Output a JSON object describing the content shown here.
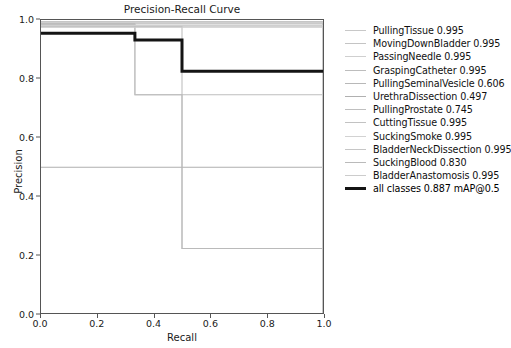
{
  "chart_data": {
    "type": "line",
    "title": "Precision-Recall Curve",
    "xlabel": "Recall",
    "ylabel": "Precision",
    "xlim": [
      0.0,
      1.0
    ],
    "ylim": [
      0.0,
      1.0
    ],
    "xticks": [
      "0.0",
      "0.2",
      "0.4",
      "0.6",
      "0.8",
      "1.0"
    ],
    "yticks": [
      "0.0",
      "0.2",
      "0.4",
      "0.6",
      "0.8",
      "1.0"
    ],
    "grid": false,
    "legend_position": "right-outside",
    "series": [
      {
        "name": "PullingTissue",
        "score": "0.995",
        "label": "PullingTissue 0.995",
        "color": "#c8c8c8",
        "linewidth": 1.0,
        "x": [
          0.0,
          1.0,
          1.0
        ],
        "y": [
          0.995,
          0.995,
          0.0
        ]
      },
      {
        "name": "MovingDownBladder",
        "score": "0.995",
        "label": "MovingDownBladder 0.995",
        "color": "#c4c4c4",
        "linewidth": 1.0,
        "x": [
          0.0,
          1.0,
          1.0
        ],
        "y": [
          0.993,
          0.993,
          0.0
        ]
      },
      {
        "name": "PassingNeedle",
        "score": "0.995",
        "label": "PassingNeedle 0.995",
        "color": "#cfcfcf",
        "linewidth": 1.0,
        "x": [
          0.0,
          1.0,
          1.0
        ],
        "y": [
          0.991,
          0.991,
          0.0
        ]
      },
      {
        "name": "GraspingCatheter",
        "score": "0.995",
        "label": "GraspingCatheter 0.995",
        "color": "#bdbdbd",
        "linewidth": 1.0,
        "x": [
          0.0,
          1.0,
          1.0
        ],
        "y": [
          0.989,
          0.989,
          0.0
        ]
      },
      {
        "name": "PullingSeminalVesicle",
        "score": "0.606",
        "label": "PullingSeminalVesicle 0.606",
        "color": "#b8b8b8",
        "linewidth": 1.0,
        "x": [
          0.0,
          0.333,
          0.333,
          0.5,
          0.5,
          1.0,
          1.0
        ],
        "y": [
          0.987,
          0.987,
          0.745,
          0.745,
          0.22,
          0.22,
          0.0
        ]
      },
      {
        "name": "UrethraDissection",
        "score": "0.497",
        "label": "UrethraDissection 0.497",
        "color": "#b0b0b0",
        "linewidth": 1.0,
        "x": [
          0.0,
          1.0,
          1.0
        ],
        "y": [
          0.497,
          0.497,
          0.0
        ]
      },
      {
        "name": "PullingProstate",
        "score": "0.745",
        "label": "PullingProstate 0.745",
        "color": "#bfbfbf",
        "linewidth": 1.0,
        "x": [
          0.0,
          0.333,
          0.333,
          1.0,
          1.0
        ],
        "y": [
          0.985,
          0.985,
          0.745,
          0.745,
          0.0
        ]
      },
      {
        "name": "CuttingTissue",
        "score": "0.995",
        "label": "CuttingTissue 0.995",
        "color": "#c2c2c2",
        "linewidth": 1.0,
        "x": [
          0.0,
          1.0,
          1.0
        ],
        "y": [
          0.983,
          0.983,
          0.0
        ]
      },
      {
        "name": "SuckingSmoke",
        "score": "0.995",
        "label": "SuckingSmoke 0.995",
        "color": "#d2d2d2",
        "linewidth": 1.0,
        "x": [
          0.0,
          1.0,
          1.0
        ],
        "y": [
          0.981,
          0.981,
          0.0
        ]
      },
      {
        "name": "BladderNeckDissection",
        "score": "0.995",
        "label": "BladderNeckDissection 0.995",
        "color": "#c6c6c6",
        "linewidth": 1.0,
        "x": [
          0.0,
          1.0,
          1.0
        ],
        "y": [
          0.979,
          0.979,
          0.0
        ]
      },
      {
        "name": "SuckingBlood",
        "score": "0.830",
        "label": "SuckingBlood 0.830",
        "color": "#bababa",
        "linewidth": 1.0,
        "x": [
          0.0,
          0.5,
          0.5,
          1.0,
          1.0
        ],
        "y": [
          0.977,
          0.977,
          0.22,
          0.22,
          0.0
        ]
      },
      {
        "name": "BladderAnastomosis",
        "score": "0.995",
        "label": "BladderAnastomosis 0.995",
        "color": "#cccccc",
        "linewidth": 1.0,
        "x": [
          0.0,
          1.0,
          1.0
        ],
        "y": [
          0.975,
          0.975,
          0.0
        ]
      },
      {
        "name": "all classes",
        "score": "0.887",
        "label": "all classes 0.887 mAP@0.5",
        "color": "#141414",
        "linewidth": 3.0,
        "mean": true,
        "x": [
          0.0,
          0.333,
          0.333,
          0.5,
          0.5,
          1.0
        ],
        "y": [
          0.955,
          0.955,
          0.932,
          0.932,
          0.825,
          0.825
        ]
      }
    ]
  },
  "legend": {
    "entries": [
      "PullingTissue 0.995",
      "MovingDownBladder 0.995",
      "PassingNeedle 0.995",
      "GraspingCatheter 0.995",
      "PullingSeminalVesicle 0.606",
      "UrethraDissection 0.497",
      "PullingProstate 0.745",
      "CuttingTissue 0.995",
      "SuckingSmoke 0.995",
      "BladderNeckDissection 0.995",
      "SuckingBlood 0.830",
      "BladderAnastomosis 0.995",
      "all classes 0.887 mAP@0.5"
    ]
  },
  "colors": {
    "background": "#ffffff",
    "axis": "#555555",
    "mean_line": "#141414",
    "class_line": "#c0c0c0",
    "text": "#1a1a1a"
  }
}
